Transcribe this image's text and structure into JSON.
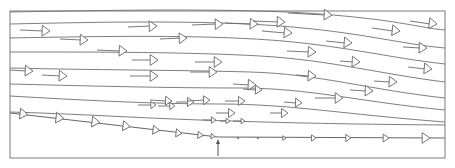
{
  "diagram": {
    "type": "streamline-flow-field",
    "colors": {
      "line": "#6f6f6f",
      "frame": "#7a7a7a",
      "background": "#ffffff"
    },
    "frame": {
      "x": 10,
      "y": 11,
      "width": 435,
      "height": 147
    },
    "streamlines": [
      "M10,12 C120,10 240,8 320,14 S420,28 445,30",
      "M10,24 C100,22 200,20 280,26 S400,44 445,48",
      "M10,38 C110,36 200,35 270,40 S390,58 445,64",
      "M10,52 C100,52 190,52 260,56 S380,74 445,82",
      "M10,68 C90,70 180,70 250,72 S370,90 445,98",
      "M10,84 C90,86 170,88 240,88 S360,102 445,110",
      "M10,96 C80,100 150,104 220,104 S340,114 445,122",
      "M10,112 C80,114 140,118 200,120 S320,124 445,125"
    ],
    "wall_streamline": {
      "path": "M10,113 L218,137 L445,138"
    },
    "separation_marker": {
      "x": 218,
      "y_from": 156,
      "y_to": 139
    },
    "vectors": [
      {
        "x1": 20,
        "y1": 30,
        "x2": 50,
        "y2": 31,
        "size": 6
      },
      {
        "x1": 60,
        "y1": 39,
        "x2": 88,
        "y2": 40,
        "size": 6
      },
      {
        "x1": 97,
        "y1": 50,
        "x2": 127,
        "y2": 51,
        "size": 6
      },
      {
        "x1": 132,
        "y1": 60,
        "x2": 158,
        "y2": 60,
        "size": 6
      },
      {
        "x1": 128,
        "y1": 27,
        "x2": 157,
        "y2": 26,
        "size": 6
      },
      {
        "x1": 160,
        "y1": 39,
        "x2": 187,
        "y2": 38,
        "size": 6
      },
      {
        "x1": 192,
        "y1": 25,
        "x2": 223,
        "y2": 24,
        "size": 6
      },
      {
        "x1": 195,
        "y1": 62,
        "x2": 222,
        "y2": 62,
        "size": 6
      },
      {
        "x1": 225,
        "y1": 23,
        "x2": 258,
        "y2": 24,
        "size": 6
      },
      {
        "x1": 253,
        "y1": 21,
        "x2": 285,
        "y2": 22,
        "size": 6
      },
      {
        "x1": 262,
        "y1": 31,
        "x2": 292,
        "y2": 33,
        "size": 6
      },
      {
        "x1": 288,
        "y1": 13,
        "x2": 332,
        "y2": 15,
        "size": 6
      },
      {
        "x1": 287,
        "y1": 51,
        "x2": 316,
        "y2": 52,
        "size": 6
      },
      {
        "x1": 326,
        "y1": 41,
        "x2": 352,
        "y2": 43,
        "size": 6
      },
      {
        "x1": 372,
        "y1": 28,
        "x2": 400,
        "y2": 31,
        "size": 6
      },
      {
        "x1": 410,
        "y1": 21,
        "x2": 437,
        "y2": 24,
        "size": 6
      },
      {
        "x1": 10,
        "y1": 70,
        "x2": 33,
        "y2": 71,
        "size": 6
      },
      {
        "x1": 42,
        "y1": 75,
        "x2": 67,
        "y2": 76,
        "size": 6
      },
      {
        "x1": 130,
        "y1": 76,
        "x2": 158,
        "y2": 76,
        "size": 6
      },
      {
        "x1": 190,
        "y1": 72,
        "x2": 217,
        "y2": 72,
        "size": 6
      },
      {
        "x1": 233,
        "y1": 84,
        "x2": 256,
        "y2": 85,
        "size": 6
      },
      {
        "x1": 296,
        "y1": 75,
        "x2": 316,
        "y2": 76,
        "size": 6
      },
      {
        "x1": 315,
        "y1": 98,
        "x2": 343,
        "y2": 98,
        "size": 6
      },
      {
        "x1": 350,
        "y1": 90,
        "x2": 373,
        "y2": 91,
        "size": 6
      },
      {
        "x1": 374,
        "y1": 81,
        "x2": 397,
        "y2": 82,
        "size": 6
      },
      {
        "x1": 408,
        "y1": 67,
        "x2": 432,
        "y2": 69,
        "size": 6
      },
      {
        "x1": 243,
        "y1": 89,
        "x2": 262,
        "y2": 90,
        "size": 5
      },
      {
        "x1": 284,
        "y1": 102,
        "x2": 302,
        "y2": 103,
        "size": 5
      },
      {
        "x1": 270,
        "y1": 113,
        "x2": 288,
        "y2": 113,
        "size": 5
      },
      {
        "x1": 150,
        "y1": 100,
        "x2": 172,
        "y2": 101,
        "size": 5
      },
      {
        "x1": 176,
        "y1": 102,
        "x2": 194,
        "y2": 102,
        "size": 5
      },
      {
        "x1": 225,
        "y1": 101,
        "x2": 245,
        "y2": 101,
        "size": 5
      },
      {
        "x1": 216,
        "y1": 113,
        "x2": 235,
        "y2": 113,
        "size": 5
      },
      {
        "x1": 188,
        "y1": 101,
        "x2": 210,
        "y2": 100,
        "size": 5
      },
      {
        "x1": 138,
        "y1": 105,
        "x2": 156,
        "y2": 105,
        "size": 4
      },
      {
        "x1": 158,
        "y1": 106,
        "x2": 175,
        "y2": 106,
        "size": 4
      },
      {
        "x1": 403,
        "y1": 47,
        "x2": 427,
        "y2": 48,
        "size": 6
      },
      {
        "x1": 340,
        "y1": 61,
        "x2": 360,
        "y2": 62,
        "size": 6
      }
    ],
    "wall_vectors": [
      {
        "x": 20,
        "y": 114,
        "size": 6
      },
      {
        "x": 56,
        "y": 118,
        "size": 6
      },
      {
        "x": 92,
        "y": 122,
        "size": 6
      },
      {
        "x": 123,
        "y": 126,
        "size": 5.5
      },
      {
        "x": 153,
        "y": 130,
        "size": 5
      },
      {
        "x": 176,
        "y": 133,
        "size": 4.5
      },
      {
        "x": 198,
        "y": 135,
        "size": 4
      },
      {
        "x": 211,
        "y": 136,
        "size": 3
      }
    ],
    "small_vectors": [
      {
        "x1": 203,
        "y1": 120,
        "x2": 216,
        "y2": 120,
        "size": 3.5
      },
      {
        "x1": 220,
        "y1": 121,
        "x2": 230,
        "y2": 121,
        "size": 3
      },
      {
        "x1": 233,
        "y1": 121,
        "x2": 245,
        "y2": 121,
        "size": 3
      }
    ],
    "downstream_wall_dots": [
      {
        "x": 238,
        "y": 138
      },
      {
        "x": 258,
        "y": 138
      }
    ],
    "downstream_wall_vectors": [
      {
        "x": 286,
        "y": 138,
        "size": 2.5
      },
      {
        "x": 316,
        "y": 138,
        "size": 3.5
      },
      {
        "x": 351,
        "y": 138,
        "size": 4
      },
      {
        "x": 389,
        "y": 138,
        "size": 4.5
      },
      {
        "x": 430,
        "y": 138,
        "size": 6
      }
    ]
  }
}
